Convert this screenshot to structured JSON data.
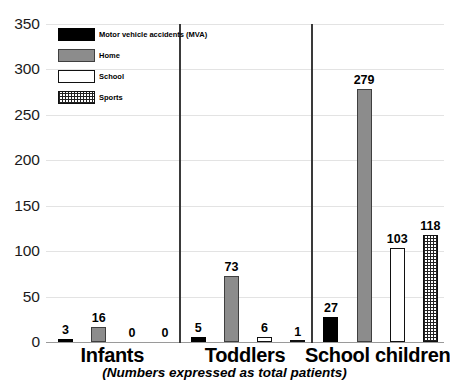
{
  "chart_data": {
    "type": "bar",
    "title": "",
    "subtitle": "",
    "caption": "(Numbers expressed as total patients)",
    "xlabel": "",
    "ylabel": "",
    "ylim": [
      0,
      350
    ],
    "yticks": [
      0,
      50,
      100,
      150,
      200,
      250,
      300,
      350
    ],
    "grid": true,
    "legend_position": "top-left-inside",
    "categories": [
      "Infants",
      "Toddlers",
      "School children"
    ],
    "series": [
      {
        "name": "Motor vehicle accidents (MVA)",
        "color": "#000000",
        "pattern": "solid",
        "values": [
          3,
          5,
          27
        ]
      },
      {
        "name": "Home",
        "color": "#8c8c8c",
        "pattern": "solid",
        "values": [
          16,
          73,
          279
        ]
      },
      {
        "name": "School",
        "color": "#ffffff",
        "pattern": "outline",
        "values": [
          0,
          6,
          103
        ]
      },
      {
        "name": "Sports",
        "color": "#ffffff",
        "pattern": "crosshatch",
        "values": [
          0,
          1,
          118
        ]
      }
    ],
    "value_labels": [
      [
        "3",
        "16",
        "0",
        "0"
      ],
      [
        "5",
        "73",
        "6",
        "1"
      ],
      [
        "27",
        "279",
        "103",
        "118"
      ]
    ],
    "ytick_labels": [
      "0",
      "50",
      "100",
      "150",
      "200",
      "250",
      "300",
      "350"
    ],
    "group_separators": 2
  },
  "legend": {
    "items": [
      {
        "label": "Motor vehicle accidents (MVA)"
      },
      {
        "label": "Home"
      },
      {
        "label": "School"
      },
      {
        "label": "Sports"
      }
    ]
  }
}
